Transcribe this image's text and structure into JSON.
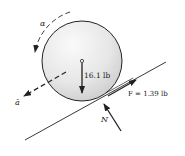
{
  "diagram": {
    "weight_label": "16.1 lb",
    "friction_label": "F = 1.39 lb",
    "normal_label": "N",
    "acceleration_label": "ā",
    "angular_label": "α",
    "colors": {
      "ink": "#222222",
      "disk_light": "#f4f4f4",
      "disk_dark": "#cfcfcf"
    }
  }
}
